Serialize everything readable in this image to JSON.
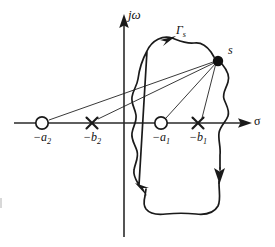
{
  "figure": {
    "width": 275,
    "height": 247,
    "background": "#ffffff",
    "stroke_color": "#1a1a1a"
  },
  "axes": {
    "vertical": {
      "label": "jω",
      "name": "imaginary-axis",
      "x": 124,
      "arrow": "up"
    },
    "horizontal": {
      "label": "σ",
      "name": "real-axis",
      "y": 123,
      "arrow": "right"
    },
    "origin": {
      "x": 124,
      "y": 123
    }
  },
  "contour": {
    "label": "Γ",
    "label_sub": "s",
    "direction": "clockwise",
    "arrows": [
      {
        "name": "contour-arrow-top",
        "direction": "right",
        "x": 168,
        "y": 40
      },
      {
        "name": "contour-arrow-right",
        "direction": "down",
        "x": 218,
        "y": 175
      },
      {
        "name": "contour-arrow-bottom-left",
        "direction": "up-left",
        "x": 141,
        "y": 192
      }
    ]
  },
  "test_point": {
    "label": "s",
    "x": 218,
    "y": 60,
    "marker": "filled-dot"
  },
  "singularities": [
    {
      "name": "zero-a2",
      "type": "zero",
      "marker": "circle",
      "label_prefix": "−",
      "label_base": "a",
      "label_sub": "2",
      "x": 42,
      "y": 123
    },
    {
      "name": "pole-b2",
      "type": "pole",
      "marker": "cross",
      "label_prefix": "−",
      "label_base": "b",
      "label_sub": "2",
      "x": 92,
      "y": 123
    },
    {
      "name": "zero-a1",
      "type": "zero",
      "marker": "circle",
      "label_prefix": "−",
      "label_base": "a",
      "label_sub": "1",
      "x": 161,
      "y": 123
    },
    {
      "name": "pole-b1",
      "type": "pole",
      "marker": "cross",
      "label_prefix": "−",
      "label_base": "b",
      "label_sub": "1",
      "x": 198,
      "y": 123
    }
  ],
  "vectors": [
    {
      "name": "vector-from-zero-a2",
      "from": "zero-a2",
      "to": "test-point"
    },
    {
      "name": "vector-from-pole-b2",
      "from": "pole-b2",
      "to": "test-point"
    },
    {
      "name": "vector-from-zero-a1",
      "from": "zero-a1",
      "to": "test-point"
    },
    {
      "name": "vector-from-pole-b1",
      "from": "pole-b1",
      "to": "test-point"
    }
  ]
}
